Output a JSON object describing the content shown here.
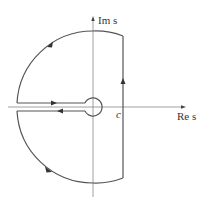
{
  "diagram": {
    "axes": {
      "imag_label": "Im s",
      "real_label": "Re s"
    },
    "point_label": "c",
    "colors": {
      "line": "#555555",
      "axis": "#888888",
      "text": "#333333"
    },
    "contour_segments": [
      {
        "name": "vertical-line-at-c",
        "direction": "up"
      },
      {
        "name": "upper-arc",
        "direction": "counterclockwise"
      },
      {
        "name": "upper-slit",
        "direction": "right"
      },
      {
        "name": "small-circle",
        "direction": "clockwise"
      },
      {
        "name": "lower-slit",
        "direction": "left"
      },
      {
        "name": "lower-arc",
        "direction": "counterclockwise"
      }
    ]
  }
}
